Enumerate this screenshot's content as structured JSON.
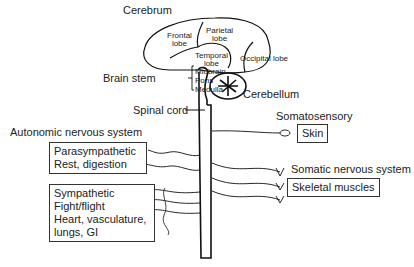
{
  "diagram": {
    "type": "nervous-system-schematic",
    "labels": {
      "cerebrum": "Cerebrum",
      "frontal_lobe": [
        "Frontal",
        "lobe"
      ],
      "parietal_lobe": [
        "Parietal",
        "lobe"
      ],
      "temporal_lobe": [
        "Temporal",
        "lobe"
      ],
      "occipital_lobe": "Occipital lobe",
      "brain_stem": "Brain stem",
      "brain_stem_parts": [
        "Midbrain",
        "Pons",
        "Medulla"
      ],
      "cerebellum": "Cerebellum",
      "spinal_cord": "Spinal cord",
      "autonomic": "Autonomic nervous system",
      "somatosensory": "Somatosensory",
      "skin": "Skin",
      "somatic": "Somatic nervous system",
      "skeletal_muscles": "Skeletal muscles"
    },
    "boxes": {
      "parasympathetic": [
        "Parasympathetic",
        "Rest, digestion"
      ],
      "sympathetic": [
        "Sympathetic",
        "Fight/flight",
        "Heart, vasculature,",
        "lungs, GI"
      ]
    }
  }
}
